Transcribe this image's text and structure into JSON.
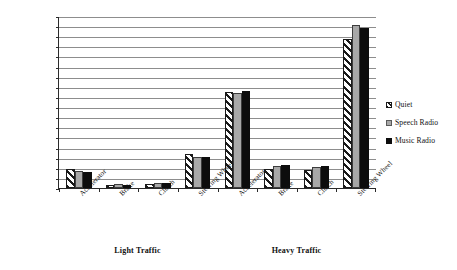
{
  "chart_data": {
    "type": "bar",
    "title": "",
    "xlabel": "",
    "ylabel": "Frequency Of Usage",
    "ylim": [
      0,
      170
    ],
    "ytick_step": 10,
    "yticks": [
      0,
      10,
      20,
      30,
      40,
      50,
      60,
      70,
      80,
      90,
      100,
      110,
      120,
      130,
      140,
      150,
      160,
      170
    ],
    "grid": true,
    "legend_position": "right",
    "groups": [
      "Light Traffic",
      "Heavy Traffic"
    ],
    "categories": [
      "Accelerator",
      "Brake",
      "Clutch",
      "Steering Wheel",
      "Accelerator",
      "Brake",
      "Clutch",
      "Steering Wheel"
    ],
    "series": [
      {
        "name": "Quiet",
        "values": [
          19,
          3,
          4,
          34,
          95,
          19,
          18,
          147
        ]
      },
      {
        "name": "Speech Radio",
        "values": [
          17,
          4,
          5,
          31,
          94,
          22,
          21,
          161
        ]
      },
      {
        "name": "Music Radio",
        "values": [
          16,
          3,
          5,
          31,
          96,
          23,
          22,
          158
        ]
      }
    ]
  },
  "axis": {
    "y_title": "Frequency Of Usage"
  },
  "legend": {
    "items": [
      {
        "label": "Quiet",
        "marker": "hatch-swatch-icon"
      },
      {
        "label": "Speech Radio",
        "marker": "gray-swatch-icon"
      },
      {
        "label": "Music Radio",
        "marker": "black-swatch-icon"
      }
    ]
  }
}
